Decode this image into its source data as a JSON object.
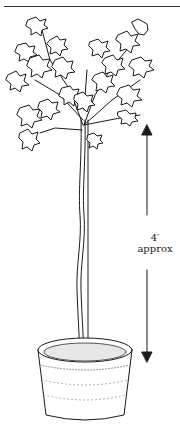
{
  "illustration": {
    "subject": "standard-trained tree in pot",
    "measurement": {
      "value": "4′",
      "qualifier": "approx"
    }
  },
  "colors": {
    "ink": "#1a1a1a",
    "background": "#ffffff"
  }
}
